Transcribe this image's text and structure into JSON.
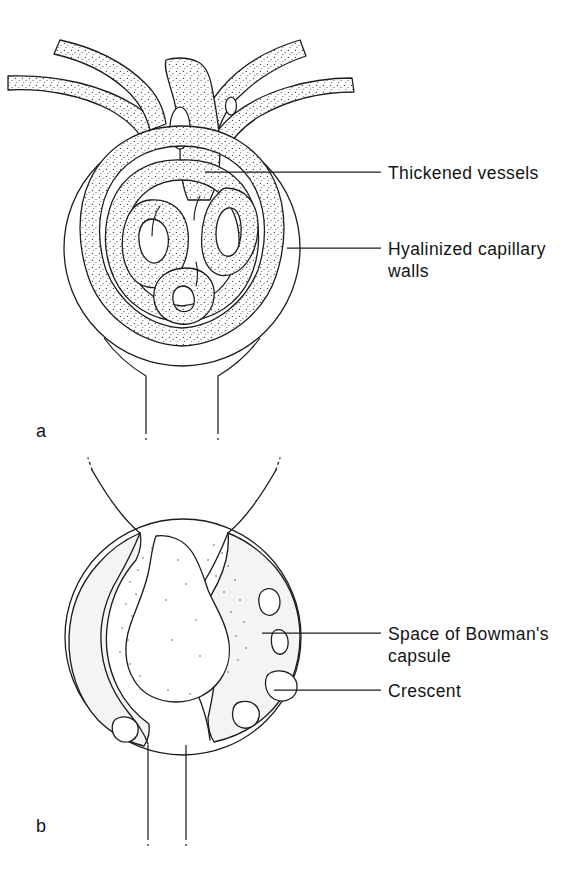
{
  "figure": {
    "title_hidden": "",
    "background_color": "#ffffff",
    "ink_color": "#1d1d1d",
    "shade_color": "#f4f4f4",
    "width": 587,
    "height": 871
  },
  "panels": [
    {
      "id": "a",
      "letter": "a",
      "letter_x": 36,
      "letter_y": 437,
      "description_hidden": "",
      "labels": [
        {
          "id": "thickened-vessels",
          "text": "Thickened vessels",
          "text_x": 388,
          "text_y": 179,
          "leader_x1": 205,
          "leader_x2": 381,
          "leader_y": 172
        },
        {
          "id": "hyalinized-capillary-walls",
          "text": "Hyalinized capillary",
          "text_line2": "walls",
          "text_x": 388,
          "text_y": 255,
          "text_y2": 277,
          "leader_x1": 287,
          "leader_x2": 381,
          "leader_y": 248
        }
      ]
    },
    {
      "id": "b",
      "letter": "b",
      "letter_x": 36,
      "letter_y": 832,
      "description_hidden": "",
      "labels": [
        {
          "id": "space-of-bowmans-capsule",
          "text": "Space of Bowman's",
          "text_line2": "capsule",
          "text_x": 388,
          "text_y": 640,
          "text_y2": 662,
          "leader_x1": 262,
          "leader_x2": 381,
          "leader_y": 633
        },
        {
          "id": "crescent",
          "text": "Crescent",
          "text_x": 388,
          "text_y": 697,
          "leader_x1": 274,
          "leader_x2": 381,
          "leader_y": 690
        }
      ]
    }
  ]
}
